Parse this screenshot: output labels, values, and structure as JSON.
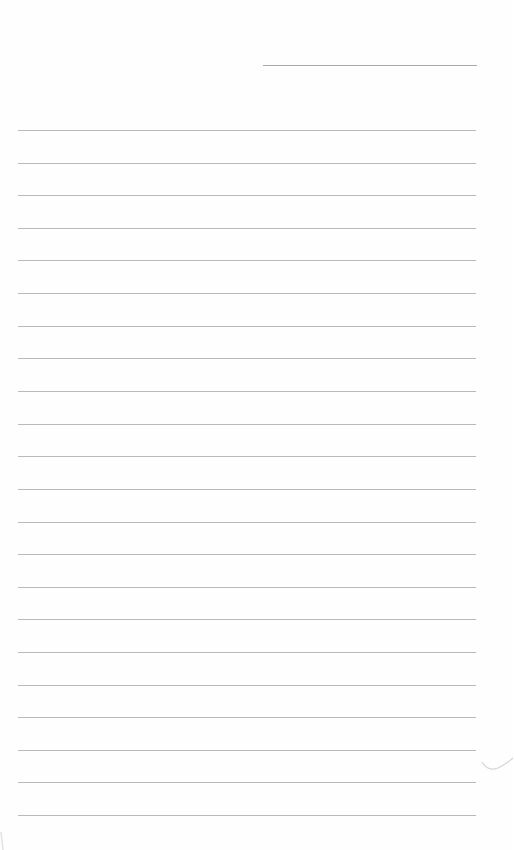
{
  "page": {
    "type": "blank lined paper",
    "header_line": {
      "x": 263,
      "width": 214,
      "y": 65
    },
    "ruled_lines": {
      "x": 18,
      "width": 458,
      "y_positions": [
        130,
        163,
        195,
        228,
        260,
        293,
        326,
        358,
        391,
        424,
        456,
        489,
        522,
        554,
        587,
        619,
        652,
        685,
        717,
        750,
        782,
        815
      ]
    },
    "line_color": "#b9b9b9",
    "background_color": "#fefefe"
  }
}
